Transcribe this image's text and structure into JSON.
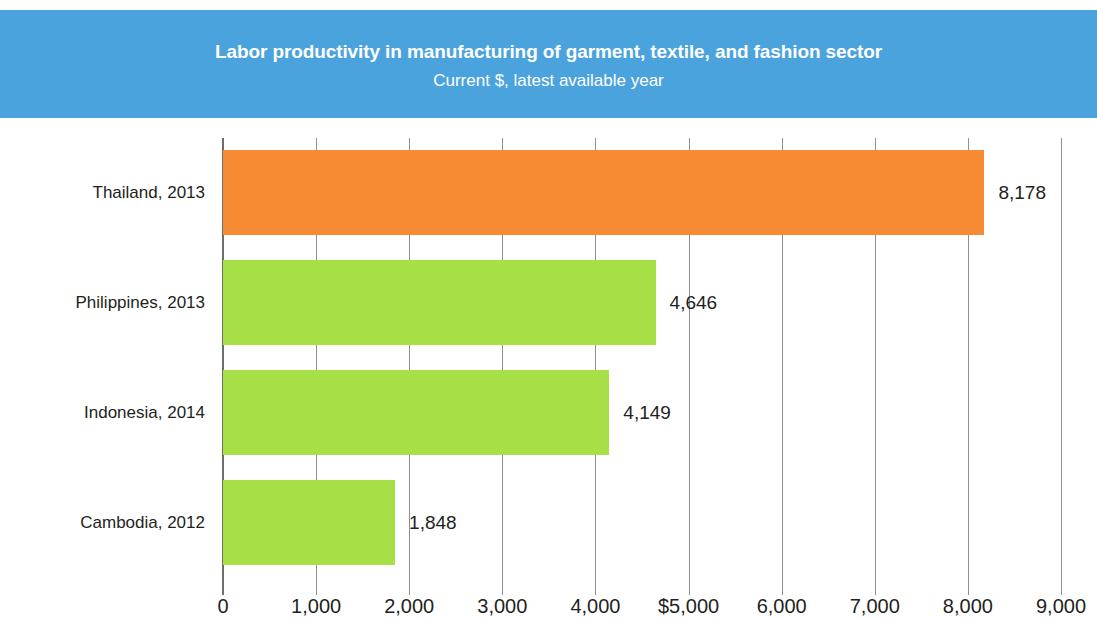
{
  "header": {
    "title": "Labor productivity in manufacturing of garment, textile, and fashion sector",
    "subtitle": "Current $, latest available year",
    "background_color": "#4ba3dd",
    "text_color": "#ffffff"
  },
  "chart_data": {
    "type": "bar",
    "orientation": "horizontal",
    "title": "Labor productivity in manufacturing of garment, textile, and fashion sector",
    "subtitle": "Current $, latest available year",
    "xlabel": "",
    "ylabel": "",
    "xlim": [
      0,
      9000
    ],
    "grid": true,
    "legend": false,
    "categories": [
      "Thailand, 2013",
      "Philippines, 2013",
      "Indonesia, 2014",
      "Cambodia, 2012"
    ],
    "values": [
      8178,
      4646,
      4149,
      1848
    ],
    "value_labels": [
      "8,178",
      "4,646",
      "4,149",
      "1,848"
    ],
    "bar_colors": [
      "#f68b33",
      "#a6e046",
      "#a6e046",
      "#a6e046"
    ],
    "xticks": [
      0,
      1000,
      2000,
      3000,
      4000,
      5000,
      6000,
      7000,
      8000,
      9000
    ],
    "xtick_labels": [
      "0",
      "1,000",
      "2,000",
      "3,000",
      "4,000",
      "$5,000",
      "6,000",
      "7,000",
      "8,000",
      "9,000"
    ]
  }
}
